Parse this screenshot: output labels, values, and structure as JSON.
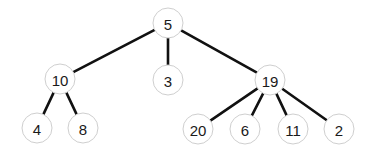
{
  "diagram": {
    "type": "tree",
    "canvas": {
      "width": 370,
      "height": 153
    },
    "node_radius": 15,
    "colors": {
      "edge": "#111111",
      "node_border": "#cfcfcf",
      "node_fill": "#ffffff",
      "text": "#1a1a1a"
    },
    "nodes": [
      {
        "id": "n5",
        "label": "5",
        "x": 168,
        "y": 23
      },
      {
        "id": "n10",
        "label": "10",
        "x": 60,
        "y": 79
      },
      {
        "id": "n3",
        "label": "3",
        "x": 168,
        "y": 80
      },
      {
        "id": "n19",
        "label": "19",
        "x": 270,
        "y": 80
      },
      {
        "id": "n4",
        "label": "4",
        "x": 37,
        "y": 128
      },
      {
        "id": "n8",
        "label": "8",
        "x": 83,
        "y": 128
      },
      {
        "id": "n20",
        "label": "20",
        "x": 198,
        "y": 129
      },
      {
        "id": "n6",
        "label": "6",
        "x": 245,
        "y": 129
      },
      {
        "id": "n11",
        "label": "11",
        "x": 293,
        "y": 129
      },
      {
        "id": "n2",
        "label": "2",
        "x": 339,
        "y": 129
      }
    ],
    "edges": [
      {
        "from": "n5",
        "to": "n10"
      },
      {
        "from": "n5",
        "to": "n3"
      },
      {
        "from": "n5",
        "to": "n19"
      },
      {
        "from": "n10",
        "to": "n4"
      },
      {
        "from": "n10",
        "to": "n8"
      },
      {
        "from": "n19",
        "to": "n20"
      },
      {
        "from": "n19",
        "to": "n6"
      },
      {
        "from": "n19",
        "to": "n11"
      },
      {
        "from": "n19",
        "to": "n2"
      }
    ]
  }
}
